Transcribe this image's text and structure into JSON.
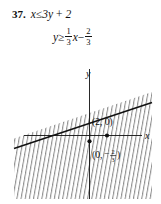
{
  "problem": {
    "number": "37.",
    "inequality_given": {
      "lhs": "x",
      "relation": "≤",
      "rhs": "3y + 2",
      "full": "x ≤ 3y + 2"
    },
    "inequality_solved": {
      "lhs": "y",
      "relation": "≥",
      "term1_numerator": "1",
      "term1_denominator": "3",
      "term1_variable": "x",
      "operator": "−",
      "term2_numerator": "2",
      "term2_denominator": "3",
      "full": "y ≥ 1/3 x − 2/3"
    }
  },
  "graph": {
    "axis_label_x": "x",
    "axis_label_y": "y",
    "point_labels": [
      {
        "name": "x-intercept-label",
        "text": "(2, 0)"
      },
      {
        "name": "y-intercept-label",
        "open": "(0,",
        "minus": "−",
        "numerator": "2",
        "denominator": "3",
        "close": ")",
        "full": "(0, −2/3)"
      }
    ],
    "boundary_line": {
      "style": "solid",
      "slope": "1/3",
      "y_intercept": "-2/3",
      "x_intercept": "2",
      "color": "#111111"
    },
    "shading": {
      "region": "below-boundary",
      "pattern": "diagonal-hatch",
      "color": "#6e6e6e"
    },
    "plotted_points": [
      {
        "name": "point-2-0",
        "x": "2",
        "y": "0"
      },
      {
        "name": "point-0-neg-two-thirds",
        "x": "0",
        "y": "-2/3"
      }
    ]
  },
  "colors": {
    "ink": "#111111",
    "hatch": "#707070",
    "background": "#ffffff"
  }
}
